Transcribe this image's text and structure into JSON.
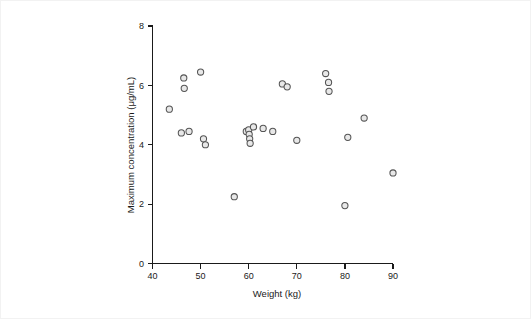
{
  "figure": {
    "background_color": "#ffffff",
    "border_color": "#f2f2f2",
    "marker_fill": "#e8e8e8",
    "marker_stroke": "#545454",
    "axis_color": "#1a1a1a"
  },
  "axes": {
    "x_title": "Weight (kg)",
    "y_title": "Maximum concentration (μg/mL)",
    "x_ticks": [
      "40",
      "50",
      "60",
      "70",
      "80",
      "90"
    ],
    "y_ticks": [
      "0",
      "2",
      "4",
      "6",
      "8"
    ]
  },
  "chart_data": {
    "type": "scatter",
    "title": "",
    "xlabel": "Weight (kg)",
    "ylabel": "Maximum concentration (μg/mL)",
    "xlim": [
      40,
      90
    ],
    "ylim": [
      0,
      8
    ],
    "xticks": [
      40,
      50,
      60,
      70,
      80,
      90
    ],
    "yticks": [
      0,
      2,
      4,
      6,
      8
    ],
    "grid": false,
    "legend": null,
    "marker": "open-circle",
    "series": [
      {
        "name": "subjects",
        "x": [
          43.5,
          46.0,
          46.5,
          46.6,
          47.6,
          50.0,
          50.6,
          51.0,
          57.0,
          59.5,
          60.0,
          60.1,
          60.2,
          60.3,
          61.0,
          63.0,
          65.0,
          67.0,
          68.0,
          70.0,
          76.0,
          76.6,
          76.7,
          80.0,
          80.6,
          84.0,
          90.0
        ],
        "y": [
          5.2,
          4.4,
          6.25,
          5.9,
          4.45,
          6.45,
          4.2,
          4.0,
          2.25,
          4.45,
          4.5,
          4.35,
          4.2,
          4.05,
          4.6,
          4.55,
          4.45,
          6.05,
          5.95,
          4.15,
          6.4,
          6.1,
          5.8,
          1.95,
          4.25,
          4.9,
          3.05
        ]
      }
    ]
  }
}
